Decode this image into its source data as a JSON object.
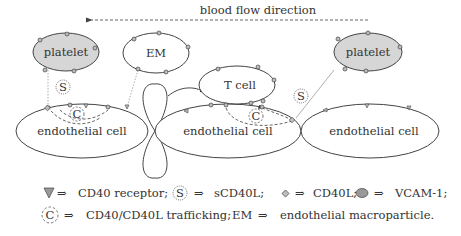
{
  "flow": {
    "label": "blood flow direction",
    "arrow_direction": "left"
  },
  "cells": {
    "platelet_left": "platelet",
    "em": "EM",
    "t_cell": "T cell",
    "platelet_right": "platelet",
    "endo_left": "endothelial cell",
    "endo_mid": "endothelial cell",
    "endo_right": "endothelial cell"
  },
  "markers": {
    "s_symbol": "S",
    "c_symbol": "C"
  },
  "legend": {
    "row1": [
      {
        "icon": "triangle-icon",
        "arrow": "⇒",
        "text": "CD40 receptor;"
      },
      {
        "icon": "circled-s-icon",
        "symbol": "S",
        "arrow": "⇒",
        "text": "sCD40L;"
      },
      {
        "icon": "diamond-icon",
        "arrow": "⇒",
        "text": "CD40L;"
      },
      {
        "icon": "ellipse-icon",
        "arrow": "⇒",
        "text": "VCAM-1;"
      }
    ],
    "row2": [
      {
        "icon": "dashed-circled-c-icon",
        "symbol": "C",
        "arrow": "⇒",
        "text": "CD40/CD40L trafficking;"
      },
      {
        "symbol": "EM",
        "arrow": "⇒",
        "text": "endothelial macroparticle."
      }
    ]
  },
  "colors": {
    "platelet_fill": "#d6d6d6",
    "marker_fill": "#bdbdbd",
    "stroke": "#444444"
  }
}
